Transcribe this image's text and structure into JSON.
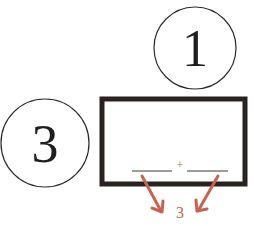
{
  "diagram": {
    "circles": [
      {
        "label": "1",
        "cx": 195,
        "cy": 48,
        "r": 42
      },
      {
        "label": "3",
        "cx": 45,
        "cy": 143,
        "r": 44
      }
    ],
    "box": {
      "x": 102,
      "y": 99,
      "width": 143,
      "height": 86,
      "border_color": "#2a2220"
    },
    "blanks": {
      "left_blank": "______",
      "operator": "+",
      "right_blank": "______"
    },
    "result_label": "3",
    "accent_color": "#c8634f"
  }
}
